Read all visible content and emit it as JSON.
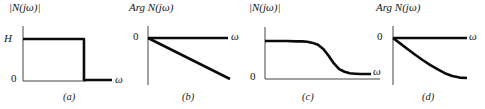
{
  "figure": {
    "background": "#ffffff",
    "curve_color": "#0b0b0b",
    "axis_color": "#474747"
  },
  "panels": [
    {
      "id": "a",
      "title": "|N(jω)|",
      "caption": "(a)",
      "labels": {
        "y_max": "H",
        "origin": "0",
        "x_end": "ω"
      }
    },
    {
      "id": "b",
      "title": "Arg N(jω)",
      "caption": "(b)",
      "labels": {
        "origin": "0",
        "x_end": "ω"
      }
    },
    {
      "id": "c",
      "title": "|N(jω)|",
      "caption": "(c)",
      "labels": {
        "origin": "0",
        "x_end": "ω"
      }
    },
    {
      "id": "d",
      "title": "Arg N(jω)",
      "caption": "(d)",
      "labels": {
        "origin": "0",
        "x_end": "ω"
      }
    }
  ],
  "chart_data": [
    {
      "type": "line",
      "title": "|N(jω)|",
      "xlabel": "ω",
      "ylabel": "",
      "xlim": [
        0,
        1
      ],
      "ylim": [
        0,
        1
      ],
      "grid": false,
      "y_tick_labels": {
        "1": "H",
        "0": "0"
      },
      "x": [
        0,
        0.685,
        0.685,
        1
      ],
      "y": [
        1,
        1,
        0,
        0
      ]
    },
    {
      "type": "line",
      "title": "Arg N(jω)",
      "xlabel": "ω",
      "ylabel": "",
      "xlim": [
        0,
        1
      ],
      "ylim": [
        -1,
        0
      ],
      "grid": false,
      "y_tick_labels": {
        "0": "0"
      },
      "x": [
        0,
        1
      ],
      "y": [
        0,
        -1
      ]
    },
    {
      "type": "line",
      "title": "|N(jω)|",
      "xlabel": "ω",
      "ylabel": "",
      "xlim": [
        0,
        1
      ],
      "ylim": [
        0,
        1
      ],
      "grid": false,
      "y_tick_labels": {
        "0": "0"
      },
      "x": [
        0,
        0.1,
        0.2,
        0.3,
        0.35,
        0.4,
        0.45,
        0.5,
        0.55,
        0.6,
        0.65,
        0.7,
        0.75,
        0.8,
        0.85,
        0.9,
        1
      ],
      "y": [
        1,
        1,
        1,
        0.99,
        0.99,
        0.98,
        0.95,
        0.9,
        0.79,
        0.61,
        0.41,
        0.26,
        0.19,
        0.15,
        0.14,
        0.13,
        0.13
      ]
    },
    {
      "type": "line",
      "title": "Arg N(jω)",
      "xlabel": "ω",
      "ylabel": "",
      "xlim": [
        0,
        1
      ],
      "ylim": [
        -1,
        0
      ],
      "grid": false,
      "y_tick_labels": {
        "0": "0"
      },
      "x": [
        0,
        0.1,
        0.2,
        0.3,
        0.4,
        0.5,
        0.6,
        0.7,
        0.8,
        0.9,
        1
      ],
      "y": [
        0,
        -0.14,
        -0.28,
        -0.42,
        -0.55,
        -0.67,
        -0.78,
        -0.88,
        -0.95,
        -0.99,
        -1
      ]
    }
  ]
}
